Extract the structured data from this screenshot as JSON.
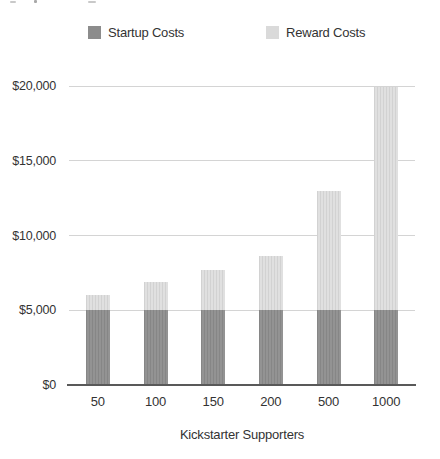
{
  "legend": {
    "items": [
      {
        "label": "Startup Costs",
        "color": "#8c8c8c"
      },
      {
        "label": "Reward Costs",
        "color": "#dadada"
      }
    ]
  },
  "chart_data": {
    "type": "bar",
    "stacked": true,
    "title": "",
    "xlabel": "Kickstarter Supporters",
    "ylabel": "",
    "categories": [
      "50",
      "100",
      "150",
      "200",
      "500",
      "1000"
    ],
    "series": [
      {
        "name": "Startup Costs",
        "color": "#8c8c8c",
        "values": [
          5000,
          5000,
          5000,
          5000,
          5000,
          5000
        ]
      },
      {
        "name": "Reward Costs",
        "color": "#dadada",
        "values": [
          1000,
          1900,
          2700,
          3600,
          8000,
          14900
        ]
      }
    ],
    "totals": [
      6000,
      6900,
      7700,
      8600,
      13000,
      19900
    ],
    "ylim": [
      0,
      20000
    ],
    "ytick_values": [
      0,
      5000,
      10000,
      15000,
      20000
    ],
    "ytick_labels": [
      "$0",
      "$5,000",
      "$10,000",
      "$15,000",
      "$20,000"
    ],
    "grid": true,
    "legend_position": "top"
  }
}
